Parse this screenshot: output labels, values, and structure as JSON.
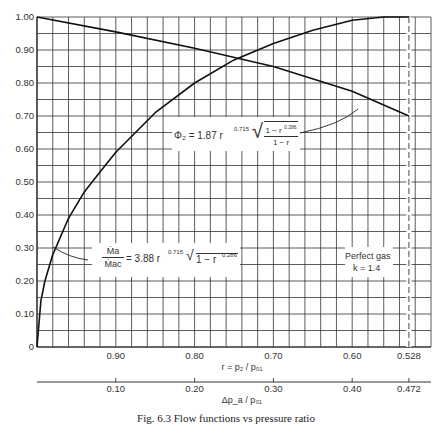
{
  "chart_data": {
    "type": "line",
    "title": "",
    "caption": "Fig. 6.3 Flow functions vs pressure ratio",
    "xlabel": "r = p₂ / p₀₁",
    "xlabel2": "Δp_a / p₀₁",
    "ylabel": "",
    "xlim": [
      1.0,
      0.5
    ],
    "ylim": [
      0,
      1.0
    ],
    "grid": true,
    "y_ticks": [
      "0",
      "0.10",
      "0.20",
      "0.30",
      "0.40",
      "0.50",
      "0.60",
      "0.70",
      "0.80",
      "0.90",
      "1.00"
    ],
    "x_ticks": [
      "0.90",
      "0.80",
      "0.70",
      "0.60",
      "0.528"
    ],
    "x2_ticks": [
      "0.10",
      "0.20",
      "0.30",
      "0.40",
      "0.472"
    ],
    "critical_line": {
      "r": 0.528,
      "style": "dashed"
    },
    "series": [
      {
        "name": "Ma/Mac = 3.88 r^0.715 sqrt(1 - r^0.286)",
        "x": [
          1.0,
          0.995,
          0.99,
          0.98,
          0.96,
          0.94,
          0.92,
          0.9,
          0.85,
          0.8,
          0.75,
          0.7,
          0.65,
          0.6,
          0.56,
          0.528
        ],
        "y": [
          0.0,
          0.14,
          0.2,
          0.28,
          0.39,
          0.47,
          0.53,
          0.59,
          0.71,
          0.8,
          0.87,
          0.92,
          0.96,
          0.99,
          1.0,
          1.0
        ]
      },
      {
        "name": "Φ₂ = 1.87 r^0.715 sqrt((1 - r^0.286)/(1 - r))",
        "x": [
          1.0,
          0.9,
          0.8,
          0.7,
          0.6,
          0.528
        ],
        "y": [
          1.0,
          0.955,
          0.905,
          0.85,
          0.775,
          0.7
        ]
      }
    ],
    "annotations": [
      {
        "text_num": "Ṁa",
        "text_den": "Ṁac",
        "text_eq": "= 3.88 r",
        "exp1": "0.715",
        "root": "1 − r",
        "exp2": "0.286"
      },
      {
        "text_eq": "Φ₂ = 1.87 r",
        "exp1": "0.715",
        "root_num": "1 − r",
        "exp2": "0.286",
        "root_den": "1 − r"
      },
      {
        "line1": "Perfect gas",
        "line2": "k = 1.4"
      }
    ]
  }
}
